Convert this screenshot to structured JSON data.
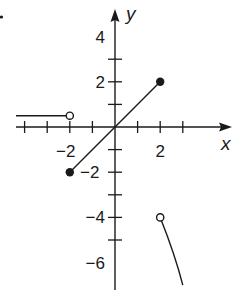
{
  "problem_marker": ".",
  "chart_data": {
    "type": "line",
    "title": "",
    "xlabel": "x",
    "ylabel": "y",
    "xlim": [
      -4.4,
      5.2
    ],
    "ylim": [
      -7.2,
      5.2
    ],
    "grid": false,
    "x_tick_labels": [
      {
        "value": -2,
        "label": "−2"
      },
      {
        "value": 2,
        "label": "2"
      }
    ],
    "y_tick_labels": [
      {
        "value": 4,
        "label": "4"
      },
      {
        "value": 2,
        "label": "2"
      },
      {
        "value": -2,
        "label": "−2"
      },
      {
        "value": -4,
        "label": "−4"
      },
      {
        "value": -6,
        "label": "−6"
      }
    ],
    "x_ticks": [
      -4,
      -3,
      -2,
      -1,
      1,
      2,
      3
    ],
    "y_ticks": [
      3,
      2,
      1,
      -1,
      -2,
      -3,
      -4,
      -5
    ],
    "series": [
      {
        "name": "piece-1",
        "kind": "segment",
        "points": [
          [
            -4.4,
            0.5
          ],
          [
            -2,
            0.5
          ]
        ],
        "start": "open-arrowless",
        "end": "open-circle"
      },
      {
        "name": "piece-2",
        "kind": "segment",
        "points": [
          [
            -2,
            -2
          ],
          [
            2,
            2
          ]
        ],
        "start": "closed-dot",
        "end": "closed-dot"
      },
      {
        "name": "piece-3",
        "kind": "curve",
        "points": [
          [
            2,
            -4
          ],
          [
            2.4,
            -5
          ],
          [
            2.75,
            -6
          ],
          [
            3.0,
            -7.0
          ]
        ],
        "start": "open-circle",
        "end": "none"
      }
    ]
  }
}
